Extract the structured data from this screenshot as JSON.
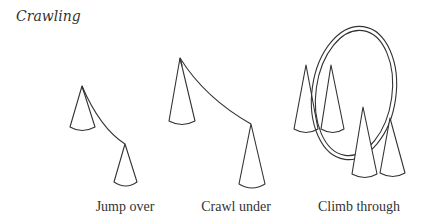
{
  "title": "Crawling",
  "sections": [
    {
      "id": "jump-over",
      "label": "Jump over"
    },
    {
      "id": "crawl-under",
      "label": "Crawl under"
    },
    {
      "id": "climb-through",
      "label": "Climb through"
    }
  ],
  "colors": {
    "ink": "#333333",
    "background": "#ffffff"
  }
}
